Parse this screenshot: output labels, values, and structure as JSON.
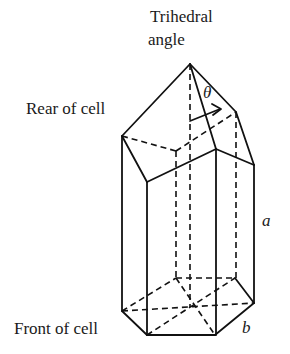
{
  "labels": {
    "trihedral": "Trihedral",
    "angle": "angle",
    "rear": "Rear of cell",
    "front": "Front of cell",
    "theta": "θ",
    "a": "a",
    "b": "b"
  },
  "colors": {
    "line": "#111111",
    "text": "#1a1a1a",
    "background": "#ffffff"
  }
}
